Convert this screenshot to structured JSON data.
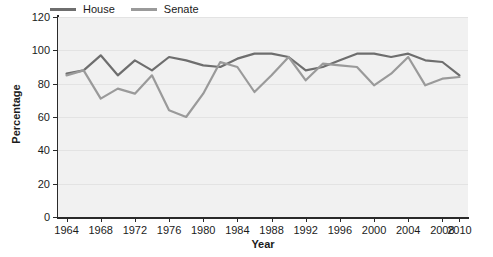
{
  "chart_data": {
    "type": "line",
    "title": "",
    "xlabel": "Year",
    "ylabel": "Percentage",
    "xlim": [
      1963,
      2011
    ],
    "ylim": [
      0,
      120
    ],
    "ytick_values": [
      0,
      20,
      40,
      60,
      80,
      100,
      120
    ],
    "ytick_labels": [
      "0",
      "20",
      "40",
      "60",
      "80",
      "100",
      "120"
    ],
    "xtick_values": [
      1964,
      1968,
      1972,
      1976,
      1980,
      1984,
      1988,
      1992,
      1996,
      2000,
      2004,
      2008,
      2010
    ],
    "xtick_labels": [
      "1964",
      "1968",
      "1972",
      "1976",
      "1980",
      "1984",
      "1988",
      "1992",
      "1996",
      "2000",
      "2004",
      "2008",
      "2010"
    ],
    "grid": true,
    "grid_axis": "y",
    "legend_position": "top-left-outside",
    "plot_background": "#f1f1f1",
    "grid_color": "#e3e3e3",
    "axis_color": "#2a2a2a",
    "x": [
      1964,
      1966,
      1968,
      1970,
      1972,
      1974,
      1976,
      1978,
      1980,
      1982,
      1984,
      1986,
      1988,
      1990,
      1992,
      1994,
      1996,
      1998,
      2000,
      2002,
      2004,
      2006,
      2008,
      2010
    ],
    "series": [
      {
        "name": "House",
        "color": "#6e6e6e",
        "values": [
          86,
          88,
          97,
          85,
          94,
          88,
          96,
          94,
          91,
          90,
          95,
          98,
          98,
          96,
          88,
          90,
          94,
          98,
          98,
          96,
          98,
          94,
          93,
          85
        ]
      },
      {
        "name": "Senate",
        "color": "#9a9a9a",
        "values": [
          85,
          88,
          71,
          77,
          74,
          85,
          64,
          60,
          74,
          93,
          90,
          75,
          85,
          96,
          82,
          92,
          91,
          90,
          79,
          86,
          96,
          79,
          83,
          84
        ]
      }
    ]
  },
  "legend": {
    "entries": [
      {
        "label": "House",
        "color": "#6e6e6e"
      },
      {
        "label": "Senate",
        "color": "#9a9a9a"
      }
    ]
  }
}
